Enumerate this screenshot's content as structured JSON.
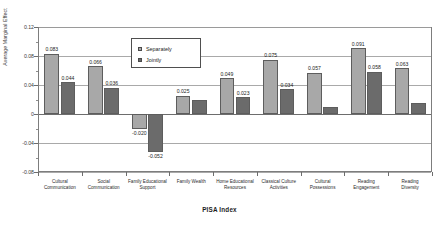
{
  "chart_data": {
    "type": "bar",
    "title": "",
    "xlabel": "PISA Index",
    "ylabel": "Average Marginal Effect",
    "ylim": [
      -0.08,
      0.12
    ],
    "yticks": [
      "0.12",
      "0.08",
      "0.04",
      "0",
      "-0.04",
      "-0.08"
    ],
    "grid": true,
    "legend_position": "upper-center-left",
    "categories": [
      "Cultural Communication",
      "Social Communication",
      "Family Educational Support",
      "Family Wealth",
      "Home Educational Resources",
      "Classical Culture Activities",
      "Cultural Possessions",
      "Reading Engagement",
      "Reading Diversity"
    ],
    "category_lines": [
      [
        "Cultural",
        "Communication"
      ],
      [
        "Social",
        "Communication"
      ],
      [
        "Family Educational",
        "Support"
      ],
      [
        "Family Wealth"
      ],
      [
        "Home Educational",
        "Resources"
      ],
      [
        "Classical Culture",
        "Activities"
      ],
      [
        "Cultural",
        "Possessions"
      ],
      [
        "Reading",
        "Engagement"
      ],
      [
        "Reading",
        "Diversity"
      ]
    ],
    "series": [
      {
        "name": "Separately",
        "color": "#a8a8a8",
        "values": [
          0.083,
          0.066,
          -0.02,
          0.025,
          0.049,
          0.075,
          0.057,
          0.091,
          0.063
        ],
        "labels": [
          "0.083",
          "0.066",
          "-0.020",
          "0.025",
          "0.049",
          "0.075",
          "0.057",
          "0.091",
          "0.063"
        ]
      },
      {
        "name": "Jointly",
        "color": "#6b6b6b",
        "values": [
          0.044,
          0.036,
          -0.052,
          0.019,
          0.023,
          0.034,
          0.01,
          0.058,
          0.015
        ],
        "labels": [
          "0.044",
          "0.036",
          "-0.052",
          "",
          "0.023",
          "0.034",
          "",
          "0.058",
          ""
        ]
      }
    ]
  },
  "legend": {
    "items": [
      {
        "label": "Separately"
      },
      {
        "label": "Jointly"
      }
    ]
  },
  "top_cropped_text": ""
}
